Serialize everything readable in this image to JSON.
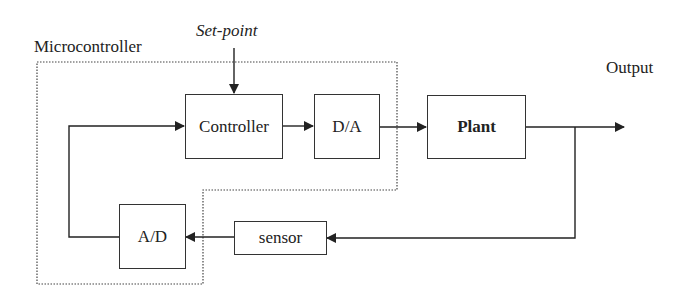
{
  "diagram": {
    "type": "block-diagram",
    "region_label": "Microcontroller",
    "input_label": "Set-point",
    "output_label": "Output",
    "blocks": [
      {
        "id": "controller",
        "label": "Controller"
      },
      {
        "id": "da",
        "label": "D/A"
      },
      {
        "id": "plant",
        "label": "Plant"
      },
      {
        "id": "sensor",
        "label": "sensor"
      },
      {
        "id": "ad",
        "label": "A/D"
      }
    ],
    "edges": [
      {
        "from": "Set-point",
        "to": "controller"
      },
      {
        "from": "controller",
        "to": "da"
      },
      {
        "from": "da",
        "to": "plant"
      },
      {
        "from": "plant",
        "to": "Output"
      },
      {
        "from": "plant",
        "to": "sensor"
      },
      {
        "from": "sensor",
        "to": "ad"
      },
      {
        "from": "ad",
        "to": "controller"
      }
    ],
    "colors": {
      "line": "#333333",
      "background": "#ffffff"
    }
  }
}
